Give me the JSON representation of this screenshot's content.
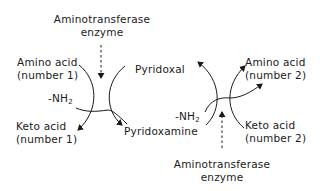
{
  "diagram": {
    "type": "transamination-cycle",
    "colors": {
      "ink": "#1a1a1a",
      "background": "#ffffff"
    },
    "left_cycle": {
      "enzyme": {
        "line1": "Aminotransferase",
        "line2": "enzyme"
      },
      "amino_acid": {
        "line1": "Amino acid",
        "line2": "(number 1)"
      },
      "keto_acid": {
        "line1": "Keto acid",
        "line2": "(number 1)"
      },
      "amine_group": {
        "text": "-NH",
        "subscript": "2"
      }
    },
    "center": {
      "pyridoxal": "Pyridoxal",
      "pyridoxamine": "Pyridoxamine"
    },
    "right_cycle": {
      "enzyme": {
        "line1": "Aminotransferase",
        "line2": "enzyme"
      },
      "amino_acid": {
        "line1": "Amino acid",
        "line2": "(number 2)"
      },
      "keto_acid": {
        "line1": "Keto acid",
        "line2": "(number 2)"
      },
      "amine_group": {
        "text": "-NH",
        "subscript": "2"
      }
    }
  }
}
